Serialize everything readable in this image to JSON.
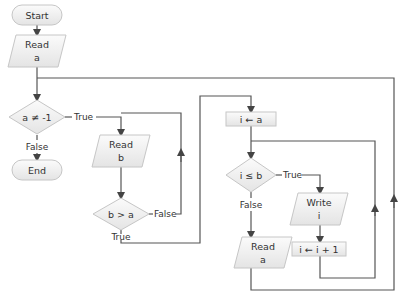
{
  "diagram": {
    "type": "flowchart",
    "nodes": {
      "start": {
        "label": "Start",
        "shape": "terminal"
      },
      "read_a_1": {
        "line1": "Read",
        "line2": "a",
        "shape": "io"
      },
      "cond_a": {
        "label": "a ≠ -1",
        "shape": "decision"
      },
      "end": {
        "label": "End",
        "shape": "terminal"
      },
      "read_b": {
        "line1": "Read",
        "line2": "b",
        "shape": "io"
      },
      "cond_ba": {
        "label": "b > a",
        "shape": "decision"
      },
      "assign_i": {
        "label": "i ← a",
        "shape": "process"
      },
      "cond_ib": {
        "label": "i ≤ b",
        "shape": "decision"
      },
      "write_i": {
        "line1": "Write",
        "line2": "i",
        "shape": "io"
      },
      "inc_i": {
        "label": "i ← i + 1",
        "shape": "process"
      },
      "read_a_2": {
        "line1": "Read",
        "line2": "a",
        "shape": "io"
      }
    },
    "edge_labels": {
      "cond_a_true": "True",
      "cond_a_false": "False",
      "cond_ba_true": "True",
      "cond_ba_false": "False",
      "cond_ib_true": "True",
      "cond_ib_false": "False"
    },
    "colors": {
      "node_fill_top": "#fafafa",
      "node_fill_bottom": "#e6e6e6",
      "node_stroke": "#c8c8c8",
      "edge": "#555555",
      "text": "#333333"
    }
  }
}
